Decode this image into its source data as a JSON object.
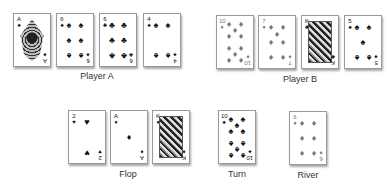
{
  "player_a": {
    "label": "Player A",
    "cards": [
      {
        "rank": "A",
        "suit": "♠",
        "suit_name": "spades"
      },
      {
        "rank": "6",
        "suit": "♠",
        "suit_name": "spades"
      },
      {
        "rank": "6",
        "suit": "♣",
        "suit_name": "clubs"
      },
      {
        "rank": "4",
        "suit": "♠",
        "suit_name": "spades"
      }
    ]
  },
  "player_b": {
    "label": "Player B",
    "cards": [
      {
        "rank": "10",
        "suit": "♦",
        "suit_name": "diamonds"
      },
      {
        "rank": "7",
        "suit": "♦",
        "suit_name": "diamonds"
      },
      {
        "rank": "K",
        "suit": "♣",
        "suit_name": "clubs"
      },
      {
        "rank": "5",
        "suit": "♠",
        "suit_name": "spades"
      }
    ]
  },
  "flop": {
    "label": "Flop",
    "cards": [
      {
        "rank": "2",
        "suit": "♥",
        "suit_name": "hearts"
      },
      {
        "rank": "A",
        "suit": "♦",
        "suit_name": "diamonds"
      },
      {
        "rank": "K",
        "suit": "♦",
        "suit_name": "diamonds"
      }
    ]
  },
  "turn": {
    "label": "Turn",
    "cards": [
      {
        "rank": "10",
        "suit": "♠",
        "suit_name": "spades"
      }
    ]
  },
  "river": {
    "label": "River",
    "cards": [
      {
        "rank": "6",
        "suit": "♦",
        "suit_name": "diamonds"
      }
    ]
  }
}
